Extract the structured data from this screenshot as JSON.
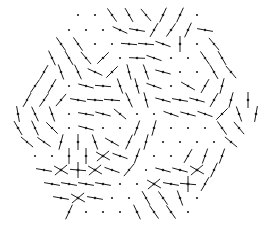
{
  "diagram": {
    "type": "hexagonal-lattice-vector-field",
    "width": 272,
    "height": 239,
    "colors": {
      "background": "#ffffff",
      "ink": "#1a1a1a"
    },
    "segment_half_length": 8,
    "dot_radius": 1.1,
    "rows": [
      {
        "y": 15,
        "x0": 78,
        "dx": 17,
        "sites": [
          "d",
          "d",
          125,
          120,
          130,
          65,
          65,
          "d"
        ]
      },
      {
        "y": 30,
        "x0": 69,
        "dx": 17,
        "sites": [
          "d",
          "d",
          "d",
          155,
          170,
          60,
          55,
          65,
          170
        ]
      },
      {
        "y": 44,
        "x0": 61,
        "dx": 17,
        "sites": [
          125,
          125,
          "d",
          "d",
          175,
          175,
          160,
          90,
          "d",
          130
        ]
      },
      {
        "y": 58,
        "x0": 52,
        "dx": 17,
        "sites": [
          115,
          120,
          130,
          45,
          "d",
          178,
          160,
          "d",
          "d",
          125,
          120
        ]
      },
      {
        "y": 72,
        "x0": 44,
        "dx": 17,
        "sites": [
          60,
          110,
          115,
          155,
          45,
          105,
          110,
          165,
          "d",
          "d",
          120,
          130
        ]
      },
      {
        "y": 86,
        "x0": 35,
        "dx": 17,
        "sites": [
          55,
          60,
          "d",
          165,
          175,
          110,
          105,
          160,
          "d",
          150,
          60,
          75
        ]
      },
      {
        "y": 100,
        "x0": 27,
        "dx": 17,
        "sites": [
          60,
          55,
          50,
          170,
          175,
          175,
          115,
          105,
          165,
          170,
          165,
          60,
          75,
          90
        ]
      },
      {
        "y": 114,
        "x0": 18,
        "dx": 17,
        "sites": [
          100,
          115,
          110,
          "d",
          170,
          165,
          140,
          "d",
          "d",
          160,
          165,
          160,
          45,
          110,
          80
        ]
      },
      {
        "y": 128,
        "x0": 18,
        "dx": 17,
        "sites": [
          120,
          115,
          135,
          "d",
          165,
          "d",
          "d",
          70,
          75,
          "d",
          "d",
          "d",
          125,
          130
        ]
      },
      {
        "y": 142,
        "x0": 27,
        "dx": 17,
        "sites": [
          140,
          145,
          75,
          90,
          110,
          150,
          65,
          75,
          "d",
          "d",
          "d",
          "d",
          140
        ]
      },
      {
        "y": 156,
        "x0": 35,
        "dx": 17,
        "sites": [
          "d",
          "d",
          90,
          90,
          "X",
          160,
          70,
          "d",
          "d",
          60,
          70,
          70
        ]
      },
      {
        "y": 170,
        "x0": 44,
        "dx": 17,
        "sites": [
          170,
          "X",
          "+",
          "X",
          160,
          50,
          "d",
          165,
          165,
          "X",
          65
        ]
      },
      {
        "y": 184,
        "x0": 52,
        "dx": 17,
        "sites": [
          170,
          170,
          170,
          170,
          "d",
          "d",
          "X",
          170,
          "+",
          60
        ]
      },
      {
        "y": 198,
        "x0": 61,
        "dx": 17,
        "sites": [
          170,
          "X",
          170,
          "d",
          "d",
          120,
          125,
          110,
          "d"
        ]
      },
      {
        "y": 212,
        "x0": 69,
        "dx": 17,
        "sites": [
          65,
          "d",
          "d",
          "d",
          115,
          125,
          125,
          "d"
        ]
      },
      {
        "y": 226,
        "x0": 78,
        "dx": 17,
        "sites": []
      }
    ]
  }
}
